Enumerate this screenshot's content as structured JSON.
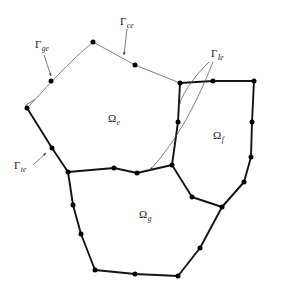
{
  "figure": {
    "type": "finite-element-subdomain-diagram",
    "background_color": "#ffffff",
    "ink_color": "#1a1a1a",
    "thin_line_color": "#6e6e6e",
    "node_color": "#000000"
  },
  "domain_labels": [
    {
      "name": "omega-e",
      "symbol": "Ω",
      "subscript": "e",
      "x": 108,
      "y": 122
    },
    {
      "name": "omega-f",
      "symbol": "Ω",
      "subscript": "f",
      "x": 213,
      "y": 139
    },
    {
      "name": "omega-g",
      "symbol": "Ω",
      "subscript": "g",
      "x": 139,
      "y": 218
    }
  ],
  "boundary_labels": [
    {
      "name": "gamma-ge",
      "symbol": "Γ",
      "subscript": "ge",
      "x": 35,
      "y": 48
    },
    {
      "name": "gamma-ce",
      "symbol": "Γ",
      "subscript": "ce",
      "x": 120,
      "y": 25
    },
    {
      "name": "gamma-Ie",
      "symbol": "Γ",
      "subscript": "Ie",
      "x": 211,
      "y": 57
    },
    {
      "name": "gamma-te",
      "symbol": "Γ",
      "subscript": "te",
      "x": 14,
      "y": 169
    }
  ],
  "leaders": [
    {
      "name": "leader-gamma-ge",
      "path": "M 44 55 L 51 76",
      "arrow_at": [
        52,
        79
      ],
      "arrow_angle": 71
    },
    {
      "name": "leader-gamma-ce",
      "path": "M 127 29 L 124 55",
      "arrow_at": [
        124,
        58
      ],
      "arrow_angle": 97
    },
    {
      "name": "leader-gamma-te",
      "path": "M 33 165 L 46 153",
      "arrow_at": [
        49,
        150
      ],
      "arrow_angle": -43
    },
    {
      "name": "leader-gamma-Ie-upper",
      "path": "M 209 62 C 197 74 185 88 179 105",
      "arrow_at": [
        178,
        109
      ],
      "arrow_angle": 104
    },
    {
      "name": "leader-gamma-Ie-lower",
      "path": "M 213 62 C 198 100 178 140 150 170",
      "arrow_at": [
        146,
        173
      ],
      "arrow_angle": 140
    }
  ],
  "polygons": {
    "omega_e": {
      "name": "subdomain-omega-e",
      "outline": "M 27 108 C 43 92 60 70 93 42 L 135 65 L 180 83 L 178 122 L 172 165 L 137 173 L 114 168 L 68 172 L 52 148 Z"
    },
    "omega_f": {
      "name": "subdomain-omega-f",
      "outline": "M 180 83 L 213 81 L 254 81 L 252 122 L 251 157 L 244 182 L 222 207 L 192 197 L 172 165 L 178 122 Z"
    },
    "omega_g": {
      "name": "subdomain-omega-g",
      "outline": "M 68 172 L 114 168 L 137 173 L 172 165 L 192 197 L 222 207 L 200 248 L 178 276 L 135 274 L 95 270 L 81 234 L 73 205 Z"
    }
  },
  "edges": {
    "gamma_ge": {
      "name": "edge-gamma-ge",
      "path": "M 27 108 C 43 92 60 70 93 42",
      "weight": "thin"
    },
    "gamma_ce": {
      "name": "edge-gamma-ce",
      "path": "M 93 42 L 135 65 L 180 83",
      "weight": "thin"
    },
    "gamma_te": {
      "name": "edge-gamma-te",
      "path": "M 27 108 L 52 148 L 68 172",
      "weight": "thick"
    },
    "interface_ef": {
      "name": "interface-omega-e-omega-f",
      "path": "M 180 83 L 178 122 L 172 165",
      "weight": "thick"
    },
    "interface_eg": {
      "name": "interface-omega-e-omega-g",
      "path": "M 68 172 L 114 168 L 137 173 L 172 165",
      "weight": "thick"
    },
    "interface_fg": {
      "name": "interface-omega-f-omega-g",
      "path": "M 172 165 L 192 197 L 222 207",
      "weight": "thick"
    },
    "omega_f_outer": {
      "name": "outer-boundary-omega-f",
      "path": "M 180 83 L 213 81 L 254 81 L 252 122 L 251 157 L 244 182 L 222 207",
      "weight": "thick"
    },
    "omega_g_outer": {
      "name": "outer-boundary-omega-g",
      "path": "M 68 172 L 73 205 L 81 234 L 95 270 L 135 274 L 178 276 L 200 248 L 222 207",
      "weight": "thick"
    }
  },
  "hatch_band": {
    "name": "clamped-support-hatching",
    "start": [
      27,
      108
    ],
    "end": [
      68,
      172
    ],
    "width": 11,
    "stripe_count": 26
  },
  "nodes": [
    {
      "name": "node-omega-e-top-left-corner",
      "x": 27,
      "y": 108
    },
    {
      "name": "node-gamma-ge-mid",
      "x": 51,
      "y": 81
    },
    {
      "name": "node-omega-e-apex",
      "x": 93,
      "y": 42
    },
    {
      "name": "node-gamma-ce-mid",
      "x": 135,
      "y": 65
    },
    {
      "name": "node-triple-junction-ef",
      "x": 180,
      "y": 83
    },
    {
      "name": "node-interface-ef-mid",
      "x": 178,
      "y": 122
    },
    {
      "name": "node-triple-junction-efg",
      "x": 172,
      "y": 165
    },
    {
      "name": "node-interface-eg-mid-right",
      "x": 137,
      "y": 173
    },
    {
      "name": "node-interface-eg-mid-left",
      "x": 114,
      "y": 168
    },
    {
      "name": "node-triple-junction-eg",
      "x": 68,
      "y": 172
    },
    {
      "name": "node-gamma-te-mid",
      "x": 52,
      "y": 148
    },
    {
      "name": "node-omega-f-top-mid",
      "x": 213,
      "y": 81
    },
    {
      "name": "node-omega-f-top-right",
      "x": 254,
      "y": 81
    },
    {
      "name": "node-omega-f-right-mid",
      "x": 252,
      "y": 122
    },
    {
      "name": "node-omega-f-right-lower",
      "x": 251,
      "y": 157
    },
    {
      "name": "node-omega-f-bottom-right",
      "x": 244,
      "y": 182
    },
    {
      "name": "node-junction-fg",
      "x": 222,
      "y": 207
    },
    {
      "name": "node-interface-fg-mid",
      "x": 192,
      "y": 197
    },
    {
      "name": "node-omega-g-left-mid",
      "x": 73,
      "y": 205
    },
    {
      "name": "node-omega-g-bottom-left-upper",
      "x": 81,
      "y": 234
    },
    {
      "name": "node-omega-g-bottom-left",
      "x": 95,
      "y": 270
    },
    {
      "name": "node-omega-g-bottom-mid",
      "x": 135,
      "y": 274
    },
    {
      "name": "node-omega-g-bottom-right",
      "x": 178,
      "y": 276
    },
    {
      "name": "node-omega-g-right-lower",
      "x": 200,
      "y": 248
    }
  ]
}
